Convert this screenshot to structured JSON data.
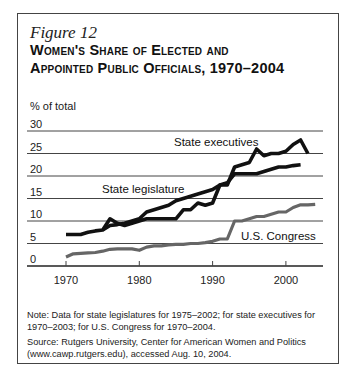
{
  "figure": {
    "label": "Figure 12",
    "title_line1": "Women's Share of Elected and",
    "title_line2": "Appointed Public Officials, 1970–2004",
    "note": "Note: Data for state legislatures for 1975–2002; for state executives for 1970–2003; for U.S. Congress for 1970–2004.",
    "source": "Source: Rutgers University, Center for American Women and Politics (www.cawp.rutgers.edu), accessed Aug. 10, 2004."
  },
  "chart_data": {
    "type": "line",
    "title": "Women's Share of Elected and Appointed Public Officials, 1970–2004",
    "xlabel": "",
    "ylabel": "% of total",
    "ylim": [
      0,
      30
    ],
    "xlim": [
      1970,
      2005
    ],
    "yticks": [
      0,
      5,
      10,
      15,
      20,
      25,
      30
    ],
    "xticks": [
      1970,
      1980,
      1990,
      2000
    ],
    "grid": true,
    "legend_position": "inline labels",
    "series": [
      {
        "name": "State executives",
        "x": [
          1970,
          1971,
          1972,
          1973,
          1974,
          1975,
          1976,
          1977,
          1978,
          1979,
          1980,
          1981,
          1982,
          1983,
          1984,
          1985,
          1986,
          1987,
          1988,
          1989,
          1990,
          1991,
          1992,
          1993,
          1994,
          1995,
          1996,
          1997,
          1998,
          1999,
          2000,
          2001,
          2002,
          2003
        ],
        "values": [
          7,
          7,
          7,
          7.5,
          7.8,
          8,
          10.5,
          9.5,
          9,
          9.5,
          10,
          10.5,
          10.5,
          10.5,
          10.5,
          10.5,
          12.5,
          12.5,
          14,
          13.5,
          14,
          18,
          18,
          22,
          22.5,
          23,
          26,
          24.5,
          25,
          25,
          25.5,
          27,
          28,
          25
        ]
      },
      {
        "name": "State legislature",
        "x": [
          1975,
          1976,
          1977,
          1978,
          1979,
          1980,
          1981,
          1982,
          1983,
          1984,
          1985,
          1986,
          1987,
          1988,
          1989,
          1990,
          1991,
          1992,
          1993,
          1994,
          1995,
          1996,
          1997,
          1998,
          1999,
          2000,
          2001,
          2002
        ],
        "values": [
          8,
          9,
          9.2,
          9.5,
          10,
          10.5,
          12,
          12.5,
          13,
          13.5,
          14.5,
          15,
          15.5,
          16,
          16.5,
          17,
          18,
          18.5,
          20.5,
          20.5,
          20.5,
          20.5,
          21,
          21.5,
          22,
          22,
          22.3,
          22.5
        ]
      },
      {
        "name": "U.S. Congress",
        "x": [
          1970,
          1971,
          1972,
          1973,
          1974,
          1975,
          1976,
          1977,
          1978,
          1979,
          1980,
          1981,
          1982,
          1983,
          1984,
          1985,
          1986,
          1987,
          1988,
          1989,
          1990,
          1991,
          1992,
          1993,
          1994,
          1995,
          1996,
          1997,
          1998,
          1999,
          2000,
          2001,
          2002,
          2003,
          2004
        ],
        "values": [
          2,
          2.7,
          2.8,
          2.9,
          3,
          3.3,
          3.7,
          3.8,
          3.8,
          3.8,
          3.5,
          4.2,
          4.5,
          4.5,
          4.7,
          4.8,
          4.8,
          5,
          5,
          5.2,
          5.5,
          6,
          6,
          10,
          10,
          10.5,
          11,
          11,
          11.5,
          12,
          12,
          13,
          13.6,
          13.6,
          13.7
        ]
      }
    ],
    "annotations": [
      {
        "text": "State executives",
        "series": "State executives"
      },
      {
        "text": "State legislature",
        "series": "State legislature"
      },
      {
        "text": "U.S. Congress",
        "series": "U.S. Congress"
      }
    ]
  }
}
